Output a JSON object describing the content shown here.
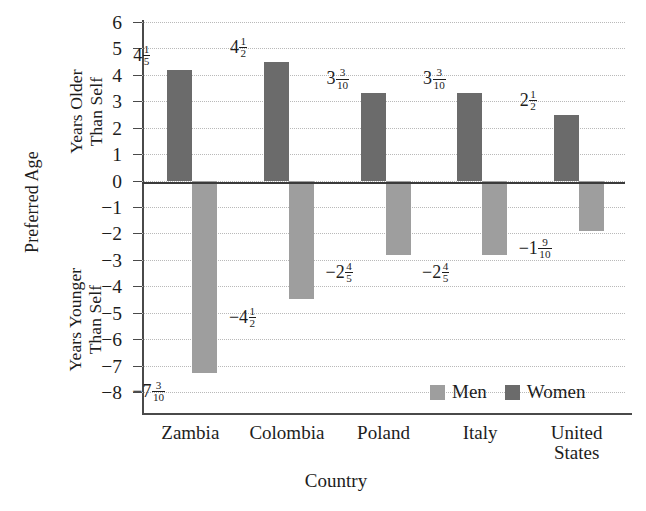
{
  "chart_data": {
    "type": "bar",
    "title": "",
    "xlabel": "Country",
    "ylabel": "Preferred Age",
    "ylabel_upper": "Years Older\nThan Self",
    "ylabel_lower": "Years Younger\nThan Self",
    "categories": [
      "Zambia",
      "Colombia",
      "Poland",
      "Italy",
      "United\nStates"
    ],
    "ylim": [
      -8,
      6
    ],
    "yticks": [
      6,
      5,
      4,
      3,
      2,
      1,
      0,
      "−1",
      "−2",
      "−3",
      "−4",
      "−5",
      "−6",
      "−7",
      "−8"
    ],
    "grid": true,
    "legend_position": "inside-bottom-right",
    "series": [
      {
        "name": "Women",
        "color": "#6b6b6b",
        "values": [
          4.2,
          4.5,
          3.3,
          3.3,
          2.5
        ],
        "labels": [
          {
            "whole": "4",
            "num": "1",
            "den": "5"
          },
          {
            "whole": "4",
            "num": "1",
            "den": "2"
          },
          {
            "whole": "3",
            "num": "3",
            "den": "10"
          },
          {
            "whole": "3",
            "num": "3",
            "den": "10"
          },
          {
            "whole": "2",
            "num": "1",
            "den": "2"
          }
        ]
      },
      {
        "name": "Men",
        "color": "#9e9e9e",
        "values": [
          -7.3,
          -4.5,
          -2.8,
          -2.8,
          -1.9
        ],
        "labels": [
          {
            "whole": "−7",
            "num": "3",
            "den": "10"
          },
          {
            "whole": "−4",
            "num": "1",
            "den": "2"
          },
          {
            "whole": "−2",
            "num": "4",
            "den": "5"
          },
          {
            "whole": "−2",
            "num": "4",
            "den": "5"
          },
          {
            "whole": "−1",
            "num": "9",
            "den": "10"
          }
        ]
      }
    ]
  },
  "legend": {
    "men_label": "Men",
    "women_label": "Women"
  },
  "axes": {
    "y_title": "Preferred Age",
    "y_upper": "Years Older\nThan Self",
    "y_lower": "Years Younger\nThan Self",
    "x_title": "Country"
  }
}
